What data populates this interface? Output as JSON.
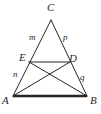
{
  "figure": {
    "type": "geometry-diagram",
    "width": 101,
    "height": 114,
    "background_color": "#ffffff",
    "stroke_color": "#262626",
    "label_color": "#262626"
  },
  "points": [
    {
      "id": "A",
      "label": "A",
      "x": 13,
      "y": 96,
      "label_x": 2,
      "label_y": 95
    },
    {
      "id": "B",
      "label": "B",
      "x": 87,
      "y": 96,
      "label_x": 90,
      "label_y": 95
    },
    {
      "id": "C",
      "label": "C",
      "x": 51,
      "y": 20,
      "label_x": 47,
      "label_y": 2
    },
    {
      "id": "E",
      "label": "E",
      "x": 29,
      "y": 62,
      "label_x": 19,
      "label_y": 52
    },
    {
      "id": "D",
      "label": "D",
      "x": 70,
      "y": 62,
      "label_x": 69,
      "label_y": 53
    }
  ],
  "segments": [
    {
      "id": "AB",
      "from": "A",
      "to": "B",
      "style": "bold",
      "width": 2.6
    },
    {
      "id": "AC",
      "from": "A",
      "to": "C",
      "style": "normal",
      "width": 1.0
    },
    {
      "id": "BC",
      "from": "B",
      "to": "C",
      "style": "normal",
      "width": 1.0
    },
    {
      "id": "ED",
      "from": "E",
      "to": "D",
      "style": "normal",
      "width": 1.0
    },
    {
      "id": "AD",
      "from": "A",
      "to": "D",
      "style": "normal",
      "width": 1.0
    },
    {
      "id": "BE",
      "from": "B",
      "to": "E",
      "style": "normal",
      "width": 1.0
    }
  ],
  "segment_labels": [
    {
      "id": "m",
      "label": "m",
      "on": "CE",
      "x": 29,
      "y": 33
    },
    {
      "id": "p",
      "label": "p",
      "on": "CD",
      "x": 63,
      "y": 33
    },
    {
      "id": "n",
      "label": "n",
      "on": "EA",
      "x": 13,
      "y": 70
    },
    {
      "id": "q",
      "label": "q",
      "on": "DB",
      "x": 80,
      "y": 73
    }
  ]
}
